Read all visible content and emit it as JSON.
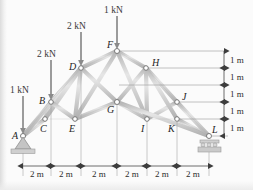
{
  "figure": {
    "type": "truss-diagram",
    "caption_fragment": "",
    "units": {
      "length": "m",
      "force": "kN"
    },
    "geometry": {
      "bay_width_m": 2,
      "level_height_m": 1,
      "num_bays": 6,
      "num_levels": 5
    },
    "nodes": [
      {
        "id": "A",
        "label": "A",
        "x_m": 0,
        "y_m": 0,
        "label_pos": "left-below"
      },
      {
        "id": "B",
        "label": "B",
        "x_m": 2,
        "y_m": 2,
        "label_pos": "left"
      },
      {
        "id": "C",
        "label": "C",
        "x_m": 2,
        "y_m": 1,
        "label_pos": "left-below"
      },
      {
        "id": "D",
        "label": "D",
        "x_m": 4,
        "y_m": 3,
        "label_pos": "left"
      },
      {
        "id": "E",
        "label": "E",
        "x_m": 4,
        "y_m": 2,
        "label_pos": "left-below"
      },
      {
        "id": "F",
        "label": "F",
        "x_m": 6,
        "y_m": 4,
        "label_pos": "left-above"
      },
      {
        "id": "G",
        "label": "G",
        "x_m": 6,
        "y_m": 2,
        "label_pos": "left-below"
      },
      {
        "id": "H",
        "label": "H",
        "x_m": 8,
        "y_m": 3,
        "label_pos": "right-above"
      },
      {
        "id": "I",
        "label": "I",
        "x_m": 8,
        "y_m": 1,
        "label_pos": "left-below"
      },
      {
        "id": "J",
        "label": "J",
        "x_m": 10,
        "y_m": 2,
        "label_pos": "right-above"
      },
      {
        "id": "K",
        "label": "K",
        "x_m": 10,
        "y_m": 1,
        "label_pos": "left-below"
      },
      {
        "id": "L",
        "label": "L",
        "x_m": 12,
        "y_m": 0,
        "label_pos": "right-above"
      }
    ],
    "members": [
      [
        "A",
        "B"
      ],
      [
        "B",
        "D"
      ],
      [
        "D",
        "F"
      ],
      [
        "F",
        "H"
      ],
      [
        "H",
        "J"
      ],
      [
        "J",
        "L"
      ],
      [
        "A",
        "C"
      ],
      [
        "C",
        "E"
      ],
      [
        "E",
        "G"
      ],
      [
        "G",
        "I"
      ],
      [
        "I",
        "K"
      ],
      [
        "K",
        "L"
      ],
      [
        "B",
        "C"
      ],
      [
        "D",
        "E"
      ],
      [
        "F",
        "G"
      ],
      [
        "H",
        "I"
      ],
      [
        "J",
        "K"
      ],
      [
        "A",
        "D"
      ],
      [
        "C",
        "D"
      ],
      [
        "E",
        "F"
      ],
      [
        "D",
        "G"
      ],
      [
        "F",
        "I"
      ],
      [
        "G",
        "H"
      ],
      [
        "H",
        "K"
      ],
      [
        "I",
        "J"
      ],
      [
        "K",
        "L"
      ],
      [
        "B",
        "E"
      ],
      [
        "G",
        "J"
      ],
      [
        "G",
        "L"
      ],
      [
        "B",
        "G"
      ]
    ],
    "loads": [
      {
        "node": "A",
        "label": "1 kN",
        "magnitude": 1,
        "direction": "down"
      },
      {
        "node": "B",
        "label": "2 kN",
        "magnitude": 2,
        "direction": "down"
      },
      {
        "node": "D",
        "label": "2 kN",
        "magnitude": 2,
        "direction": "down"
      },
      {
        "node": "F",
        "label": "1 kN",
        "magnitude": 1,
        "direction": "down"
      }
    ],
    "supports": [
      {
        "node": "A",
        "kind": "pin"
      },
      {
        "node": "L",
        "kind": "roller"
      }
    ],
    "horizontal_dimensions": {
      "labels": [
        "2 m",
        "2 m",
        "2 m",
        "2 m",
        "2 m",
        "2 m"
      ]
    },
    "vertical_dimensions": {
      "labels": [
        "1 m",
        "1 m",
        "1 m",
        "1 m",
        "1 m"
      ]
    },
    "colors": {
      "member": "#c9c9c9",
      "member_edge": "#9a9a9a",
      "node_stroke": "#6b6b6b",
      "node_fill": "#ffffff",
      "arrow": "#8a8a8a",
      "dimension": "#4a4a4a",
      "text": "#2b2b2b",
      "support": "#b9b9b9"
    }
  }
}
